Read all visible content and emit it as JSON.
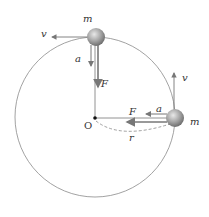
{
  "diagram": {
    "labels": {
      "mass_top": "m",
      "mass_right": "m",
      "velocity_top": "v",
      "velocity_right": "v",
      "accel_top": "a",
      "accel_right": "a",
      "force_top": "F",
      "force_right": "F",
      "center": "O",
      "radius": "r"
    },
    "colors": {
      "circle": "#888888",
      "arrow": "#777777",
      "mass": "#9a9a9a",
      "text": "#333333"
    }
  }
}
